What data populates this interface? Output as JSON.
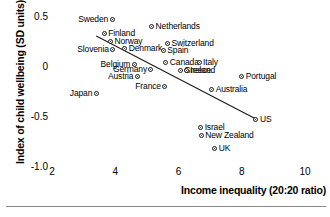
{
  "chart_data": {
    "type": "scatter",
    "title": "",
    "xlabel": "Income inequality (20:20 ratio)",
    "ylabel": "Index of child wellbeing (SD units)",
    "xlim": [
      2,
      10
    ],
    "ylim": [
      -1.0,
      0.5
    ],
    "xticks": [
      2,
      4,
      6,
      8,
      10
    ],
    "xtick_labels": [
      "2",
      "4",
      "6",
      "8",
      "10"
    ],
    "yticks": [
      0.5,
      0,
      -0.5,
      -1.0
    ],
    "ytick_labels": [
      "0.5",
      "0",
      "-0.5",
      "-1.0"
    ],
    "grid": false,
    "legend": null,
    "marker": "open-circle-with-dot",
    "points": [
      {
        "label": "Sweden",
        "x": 3.9,
        "y": 0.48,
        "lpos": "left"
      },
      {
        "label": "Netherlands",
        "x": 5.15,
        "y": 0.41,
        "lpos": "right"
      },
      {
        "label": "Finland",
        "x": 3.65,
        "y": 0.34,
        "lpos": "right"
      },
      {
        "label": "Norway",
        "x": 3.85,
        "y": 0.26,
        "lpos": "right"
      },
      {
        "label": "Switzerland",
        "x": 5.65,
        "y": 0.24,
        "lpos": "right"
      },
      {
        "label": "Slovenia",
        "x": 3.92,
        "y": 0.18,
        "lpos": "left"
      },
      {
        "label": "Denmark",
        "x": 4.3,
        "y": 0.19,
        "lpos": "right"
      },
      {
        "label": "Spain",
        "x": 5.52,
        "y": 0.17,
        "lpos": "right"
      },
      {
        "label": "Belgium",
        "x": 4.6,
        "y": 0.03,
        "lpos": "left"
      },
      {
        "label": "Canada",
        "x": 5.6,
        "y": 0.05,
        "lpos": "right"
      },
      {
        "label": "Italy",
        "x": 6.65,
        "y": 0.05,
        "lpos": "right"
      },
      {
        "label": "Germany",
        "x": 5.13,
        "y": -0.02,
        "lpos": "left"
      },
      {
        "label": "Greece",
        "x": 6.05,
        "y": -0.03,
        "lpos": "right"
      },
      {
        "label": "Ireland",
        "x": 6.24,
        "y": -0.03,
        "lpos": "right"
      },
      {
        "label": "Austria",
        "x": 4.7,
        "y": -0.09,
        "lpos": "left"
      },
      {
        "label": "Portugal",
        "x": 8.0,
        "y": -0.09,
        "lpos": "right"
      },
      {
        "label": "France",
        "x": 5.57,
        "y": -0.19,
        "lpos": "left"
      },
      {
        "label": "Australia",
        "x": 7.05,
        "y": -0.22,
        "lpos": "right"
      },
      {
        "label": "Japan",
        "x": 3.4,
        "y": -0.26,
        "lpos": "left"
      },
      {
        "label": "US",
        "x": 8.45,
        "y": -0.52,
        "lpos": "right"
      },
      {
        "label": "Israel",
        "x": 6.7,
        "y": -0.6,
        "lpos": "right"
      },
      {
        "label": "New Zealand",
        "x": 6.72,
        "y": -0.68,
        "lpos": "right"
      },
      {
        "label": "UK",
        "x": 7.15,
        "y": -0.81,
        "lpos": "right"
      }
    ],
    "trendline": {
      "type": "linear-fit",
      "x_start": 3.4,
      "y_start": 0.31,
      "x_end": 8.45,
      "y_end": -0.52
    }
  }
}
